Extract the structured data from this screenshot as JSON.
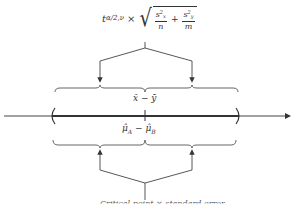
{
  "diagram": {
    "type": "confidence-interval-schematic",
    "top_formula": {
      "prefix": "t",
      "subscript": "α/2,ν",
      "operator": "×",
      "sqrt_terms": [
        {
          "numerator_base": "s",
          "numerator_sub": "x",
          "numerator_sup": "2",
          "denominator": "n"
        },
        {
          "numerator_base": "s",
          "numerator_sub": "y",
          "numerator_sup": "2",
          "denominator": "m"
        }
      ],
      "plus": "+"
    },
    "upper_label": "x̄ − ȳ",
    "lower_label": {
      "mu_a": "μ̂",
      "sub_a": "A",
      "minus": "−",
      "mu_b": "μ̂",
      "sub_b": "B"
    },
    "axis": {
      "arrow": "right",
      "interval_left": "(",
      "interval_right": ")"
    },
    "bottom_text_cut": "Critical point × standard error"
  }
}
